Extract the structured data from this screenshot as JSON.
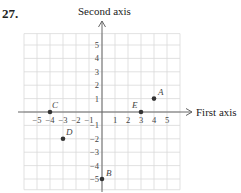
{
  "problem_number": "27.",
  "axes": {
    "x_title": "First axis",
    "y_title": "Second axis",
    "x_ticks": [
      "-5",
      "-4",
      "-3",
      "-2",
      "-1",
      "1",
      "2",
      "3",
      "4",
      "5"
    ],
    "y_ticks": [
      "5",
      "4",
      "3",
      "2",
      "1",
      "-1",
      "-2",
      "-3",
      "-4",
      "-5"
    ],
    "grid_color": "#d9d9d9",
    "axis_color": "#666666",
    "point_color": "#333333"
  },
  "points": [
    {
      "label": "A",
      "x": 4,
      "y": 1
    },
    {
      "label": "B",
      "x": 0,
      "y": -5
    },
    {
      "label": "C",
      "x": -4,
      "y": 0
    },
    {
      "label": "D",
      "x": -3,
      "y": -2
    },
    {
      "label": "E",
      "x": 3,
      "y": 0
    }
  ],
  "chart_data": {
    "type": "scatter",
    "title": "27.",
    "xlabel": "First axis",
    "ylabel": "Second axis",
    "xlim": [
      -6,
      6
    ],
    "ylim": [
      -6,
      6
    ],
    "grid": true,
    "points": [
      {
        "label": "A",
        "x": 4,
        "y": 1
      },
      {
        "label": "B",
        "x": 0,
        "y": -5
      },
      {
        "label": "C",
        "x": -4,
        "y": 0
      },
      {
        "label": "D",
        "x": -3,
        "y": -2
      },
      {
        "label": "E",
        "x": 3,
        "y": 0
      }
    ]
  }
}
